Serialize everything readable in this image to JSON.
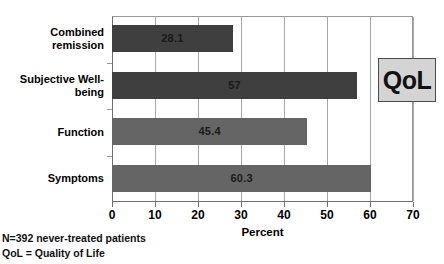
{
  "chart_data": {
    "type": "bar",
    "orientation": "horizontal",
    "title": "",
    "xlabel": "Percent",
    "ylabel": "",
    "xlim": [
      0,
      70
    ],
    "xticks": [
      "0",
      "10",
      "20",
      "30",
      "40",
      "50",
      "60",
      "70"
    ],
    "grid": "vertical",
    "legend": "none",
    "categories": [
      "Combined remission",
      "Subjective Well-being",
      "Function",
      "Symptoms"
    ],
    "category_lines": [
      [
        "Combined",
        "remission"
      ],
      [
        "Subjective Well-",
        "being"
      ],
      [
        "Function"
      ],
      [
        "Symptoms"
      ]
    ],
    "values": [
      28.1,
      57,
      45.4,
      60.3
    ],
    "value_labels": [
      "28.1",
      "57",
      "45.4",
      "60.3"
    ],
    "bar_colors": [
      "#3f3f3f",
      "#3f3f3f",
      "#656565",
      "#656565"
    ]
  },
  "callout": {
    "label": "QoL"
  },
  "footnotes": [
    "N=392 never-treated patients",
    "QoL = Quality of Life"
  ]
}
